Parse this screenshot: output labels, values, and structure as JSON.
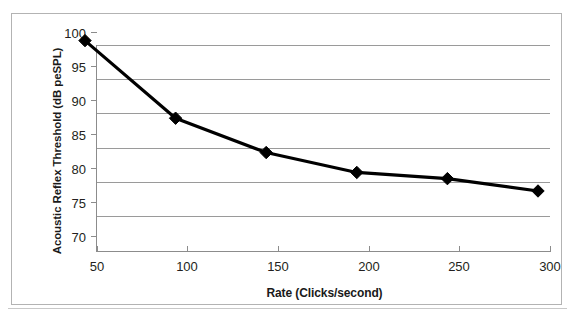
{
  "chart_data": {
    "type": "line",
    "title": "",
    "xlabel": "Rate (Clicks/second)",
    "ylabel": "Acoustic Reflex Threshold (dB peSPL)",
    "x": [
      50,
      100,
      150,
      200,
      250,
      300
    ],
    "values": [
      98.6,
      87.3,
      82.3,
      79.4,
      78.5,
      76.7
    ],
    "series": [
      {
        "name": "Acoustic Reflex Threshold",
        "values": [
          98.6,
          87.3,
          82.3,
          79.4,
          78.5,
          76.7
        ],
        "color": "#000000",
        "marker": "diamond"
      }
    ],
    "xlim": [
      50,
      300
    ],
    "ylim": [
      70,
      100
    ],
    "xticks": [
      50,
      100,
      150,
      200,
      250,
      300
    ],
    "yticks": [
      70,
      75,
      80,
      85,
      90,
      95,
      100
    ],
    "xtick_labels": [
      "50",
      "100",
      "150",
      "200",
      "250",
      "300"
    ],
    "ytick_labels": [
      "70",
      "75",
      "80",
      "85",
      "90",
      "95",
      "100"
    ],
    "grid": "horizontal",
    "legend": "none",
    "colors": {
      "line": "#000000",
      "marker": "#000000",
      "gridline": "#9a9a9a",
      "axis": "#8c8c8c",
      "frame": "#b3b3b3",
      "text": "#231f20",
      "background": "#ffffff"
    }
  }
}
